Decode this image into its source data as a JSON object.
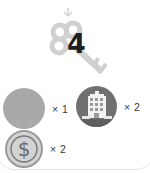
{
  "key": {
    "icon": "key-icon",
    "count": "4",
    "color": "#cfcfcf"
  },
  "resources": [
    {
      "icon": "blank-resource-icon",
      "quantity": "× 1",
      "color": "#a9a9a9"
    },
    {
      "icon": "building-icon",
      "quantity": "× 2",
      "color": "#707070"
    },
    {
      "icon": "dollar-coin-icon",
      "quantity": "× 2",
      "color": "#d3d3d3"
    }
  ]
}
